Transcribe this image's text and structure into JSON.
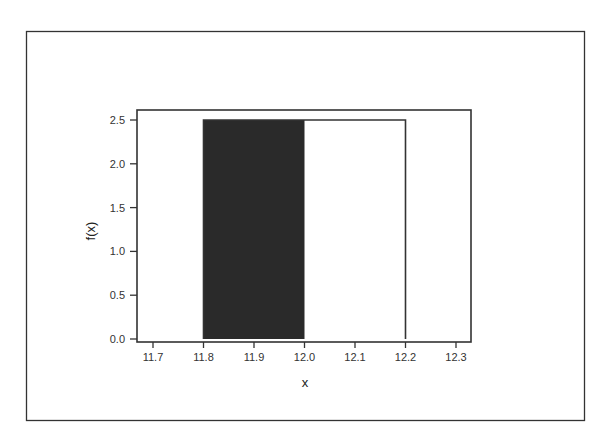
{
  "chart_data": {
    "type": "area",
    "title": "",
    "xlabel": "x",
    "ylabel": "f(x)",
    "xlim": [
      11.65,
      12.33
    ],
    "ylim": [
      0.0,
      2.5
    ],
    "x_ticks": [
      "11.7",
      "11.8",
      "11.9",
      "12.0",
      "12.1",
      "12.2",
      "12.3"
    ],
    "y_ticks": [
      "0.0",
      "0.5",
      "1.0",
      "1.5",
      "2.0",
      "2.5"
    ],
    "grid": false,
    "legend": null,
    "series": [
      {
        "name": "uniform density f(x)",
        "kind": "step-outline",
        "x": [
          11.8,
          11.8,
          12.2,
          12.2
        ],
        "y": [
          0.0,
          2.5,
          2.5,
          0.0
        ]
      },
      {
        "name": "shaded probability region",
        "kind": "filled",
        "x_range": [
          11.8,
          12.0
        ],
        "height": 2.5,
        "color": "#2a2a2a"
      }
    ],
    "annotations": []
  },
  "colors": {
    "background": "#ffffff",
    "frame": "#333333",
    "shade": "#2a2a2a",
    "text": "#333333"
  }
}
